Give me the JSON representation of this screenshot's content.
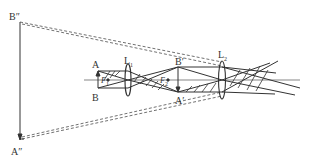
{
  "diagram": {
    "type": "optics ray diagram (compound microscope)",
    "labels": {
      "b_double_prime": "B″",
      "a_double_prime": "A″",
      "a": "A",
      "b": "B",
      "f1": "F",
      "f1_sub": "1",
      "l1": "L",
      "l1_sub": "1",
      "b_prime": "B′",
      "a_prime": "A′",
      "f2": "F",
      "f2_sub": "2",
      "l2": "L",
      "l2_sub": "2"
    },
    "colors": {
      "line": "#333333",
      "background": "#ffffff"
    }
  }
}
